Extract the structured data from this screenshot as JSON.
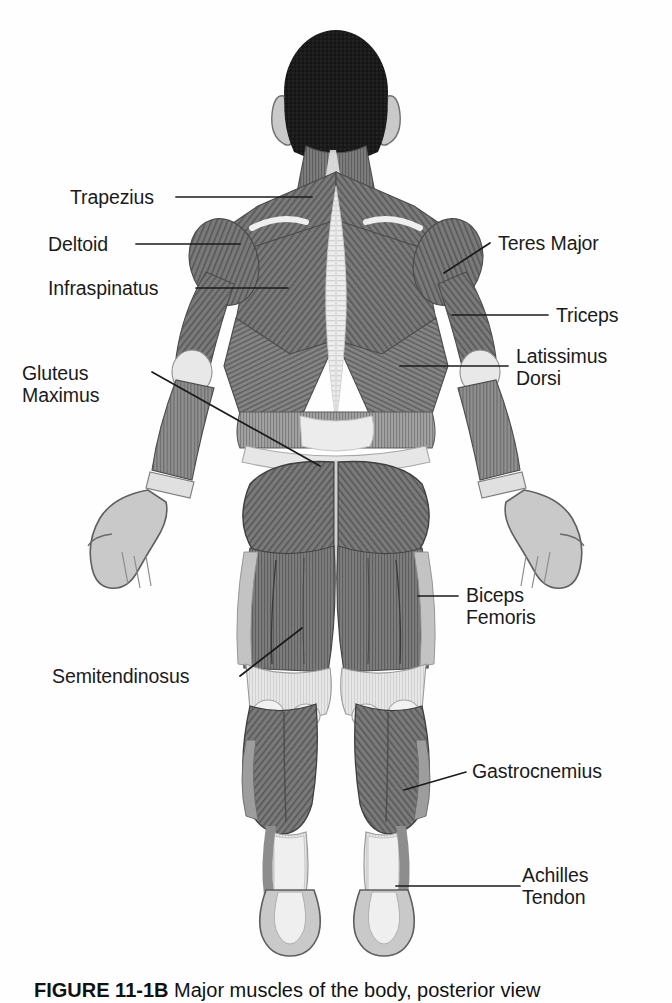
{
  "figure": {
    "view": "posterior",
    "caption_number": "FIGURE 11-1B",
    "caption_text": " Major muscles of the body, posterior view",
    "background_color": "#ffffff",
    "ink_color": "#1b1b1b"
  },
  "palette": {
    "muscle_dark": "#6d6d6d",
    "muscle_mid": "#8a8a8a",
    "muscle_light": "#b9b9b9",
    "tendon": "#e3e3e3",
    "skin": "#c9c9c9",
    "hair": "#181818",
    "outline": "#555555"
  },
  "labels": [
    {
      "id": "trapezius",
      "text": "Trapezius",
      "side": "left"
    },
    {
      "id": "deltoid",
      "text": "Deltoid",
      "side": "left"
    },
    {
      "id": "infraspinatus",
      "text": "Infraspinatus",
      "side": "left"
    },
    {
      "id": "gluteus-maximus",
      "text": "Gluteus\nMaximus",
      "side": "left"
    },
    {
      "id": "semitendinosus",
      "text": "Semitendinosus",
      "side": "left"
    },
    {
      "id": "teres-major",
      "text": "Teres Major",
      "side": "right"
    },
    {
      "id": "triceps",
      "text": "Triceps",
      "side": "right"
    },
    {
      "id": "latissimus-dorsi",
      "text": "Latissimus\nDorsi",
      "side": "right"
    },
    {
      "id": "biceps-femoris",
      "text": "Biceps\nFemoris",
      "side": "right"
    },
    {
      "id": "gastrocnemius",
      "text": "Gastrocnemius",
      "side": "right"
    },
    {
      "id": "achilles-tendon",
      "text": "Achilles\nTendon",
      "side": "right"
    }
  ]
}
